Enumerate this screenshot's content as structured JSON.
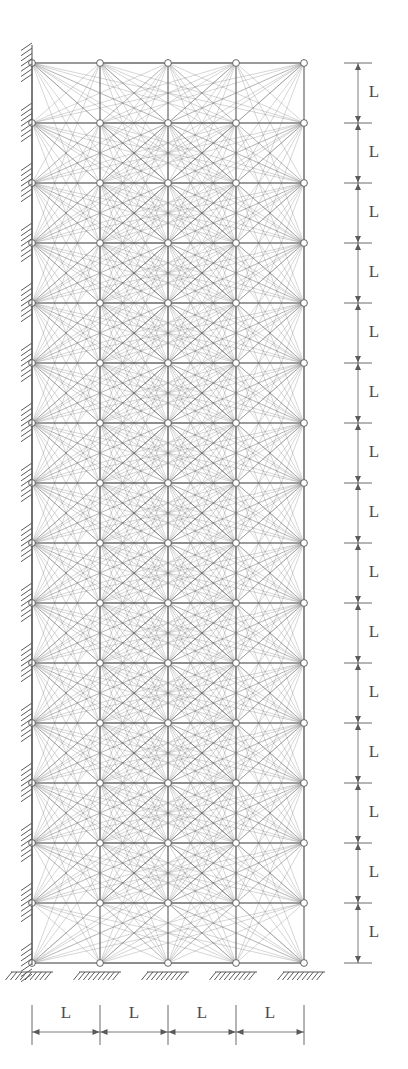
{
  "figure": {
    "type": "structural-ground-structure",
    "background_color": "#ffffff",
    "member_color": "#6a6a6a",
    "node_stroke_color": "#555555",
    "node_fill_color": "#ffffff",
    "dimension_color": "#5a5a5a",
    "support_color": "#5a5a5a",
    "label_color": "#4a4a4a"
  },
  "geometry": {
    "bays": 4,
    "stories": 15,
    "columns_of_nodes": 5,
    "rows_of_nodes": 16,
    "node_x_positions": [
      32,
      100,
      168,
      236,
      304
    ],
    "node_y_positions": [
      63,
      123,
      183,
      243,
      303,
      363,
      423,
      483,
      543,
      603,
      663,
      723,
      783,
      843,
      903,
      963
    ],
    "bay_width_px": 68,
    "story_height_px": 60,
    "node_radius": 3.4
  },
  "supports": {
    "left_wall": {
      "label": "fixed-wall-support",
      "x": 32,
      "hatch_count": 16,
      "hatch_side": "left",
      "description": "Hatched fixed support along entire left edge at each floor level"
    },
    "ground": {
      "label": "fixed-ground-support",
      "y": 963,
      "count": 5,
      "x_positions": [
        32,
        100,
        168,
        236,
        304
      ],
      "description": "Hatched fixed ground supports beneath each of the five base nodes"
    }
  },
  "dimensions": {
    "vertical": {
      "name": "story-height-dimension",
      "axis_x": 358,
      "top_y": 63,
      "bottom_y": 963,
      "segment_count": 15,
      "label": "L",
      "labels": [
        "L",
        "L",
        "L",
        "L",
        "L",
        "L",
        "L",
        "L",
        "L",
        "L",
        "L",
        "L",
        "L",
        "L",
        "L"
      ],
      "tick_extension": 14,
      "label_offset_x": 16
    },
    "horizontal": {
      "name": "bay-width-dimension",
      "axis_y": 1032,
      "left_x": 32,
      "right_x": 304,
      "segment_count": 4,
      "label": "L",
      "labels": [
        "L",
        "L",
        "L",
        "L"
      ],
      "tick_top": 1005,
      "tick_bottom": 1045,
      "label_offset_y": -18
    }
  },
  "members": {
    "description": "Fully connected ground structure: every node joined to every other node within a local neighborhood, forming a dense truss mesh",
    "neighborhood_bays": 4,
    "neighborhood_stories": 3,
    "line_width": 0.45,
    "opacity": 0.62
  }
}
